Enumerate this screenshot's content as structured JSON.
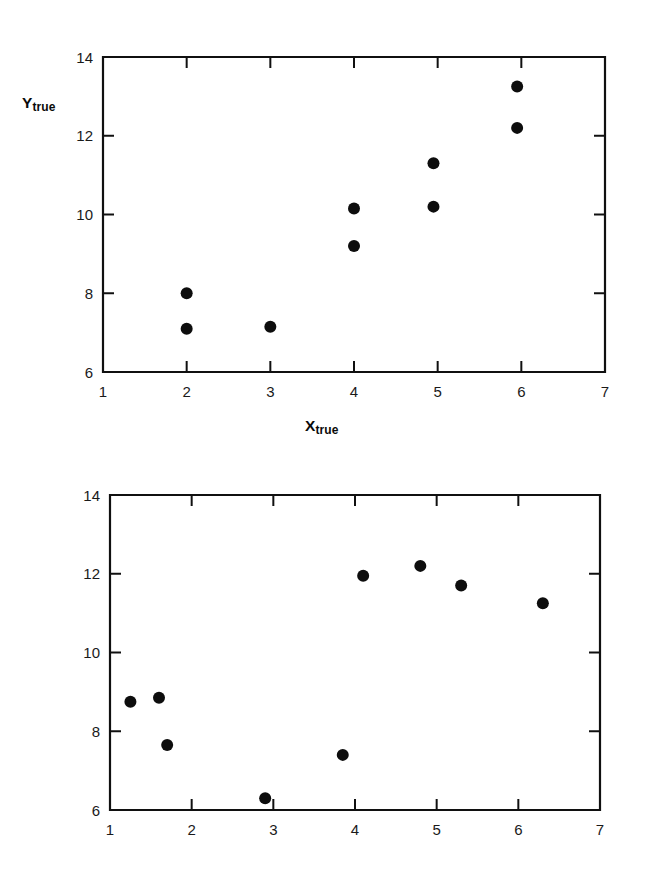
{
  "figure": {
    "background_color": "#ffffff",
    "marker_color": "#0d0d0d",
    "axis_color": "#101010"
  },
  "panels": [
    {
      "id": "top",
      "x_title_main": "X",
      "x_title_sub": "true",
      "y_title_main": "Y",
      "y_title_sub": "true"
    },
    {
      "id": "bottom",
      "x_title_main": "X",
      "x_title_sub": "error",
      "y_title_main": "Y",
      "y_title_sub": "error"
    }
  ],
  "chart_data": [
    {
      "type": "scatter",
      "title": "",
      "xlabel": "X_true",
      "ylabel": "Y_true",
      "xlim": [
        1,
        7
      ],
      "ylim": [
        6,
        14
      ],
      "xticks": [
        1,
        2,
        3,
        4,
        5,
        6,
        7
      ],
      "yticks": [
        6,
        8,
        10,
        12,
        14
      ],
      "xticklabels": [
        "1",
        "2",
        "3",
        "4",
        "5",
        "6",
        "7"
      ],
      "yticklabels": [
        "6",
        "8",
        "10",
        "12",
        "14"
      ],
      "grid": false,
      "legend": null,
      "marker": "filled-circle",
      "points": [
        {
          "x": 2.0,
          "y": 8.0
        },
        {
          "x": 2.0,
          "y": 7.1
        },
        {
          "x": 3.0,
          "y": 7.15
        },
        {
          "x": 4.0,
          "y": 10.15
        },
        {
          "x": 4.0,
          "y": 9.2
        },
        {
          "x": 4.95,
          "y": 11.3
        },
        {
          "x": 4.95,
          "y": 10.2
        },
        {
          "x": 5.95,
          "y": 13.25
        },
        {
          "x": 5.95,
          "y": 12.2
        }
      ]
    },
    {
      "type": "scatter",
      "title": "",
      "xlabel": "X_error",
      "ylabel": "Y_error",
      "xlim": [
        1,
        7
      ],
      "ylim": [
        6,
        14
      ],
      "xticks": [
        1,
        2,
        3,
        4,
        5,
        6,
        7
      ],
      "yticks": [
        6,
        8,
        10,
        12,
        14
      ],
      "xticklabels": [
        "1",
        "2",
        "3",
        "4",
        "5",
        "6",
        "7"
      ],
      "yticklabels": [
        "6",
        "8",
        "10",
        "12",
        "14"
      ],
      "grid": false,
      "legend": null,
      "marker": "filled-circle",
      "points": [
        {
          "x": 1.25,
          "y": 8.75
        },
        {
          "x": 1.6,
          "y": 8.85
        },
        {
          "x": 1.7,
          "y": 7.65
        },
        {
          "x": 2.9,
          "y": 6.3
        },
        {
          "x": 3.85,
          "y": 7.4
        },
        {
          "x": 4.1,
          "y": 11.95
        },
        {
          "x": 4.8,
          "y": 12.2
        },
        {
          "x": 5.3,
          "y": 11.7
        },
        {
          "x": 6.3,
          "y": 11.25
        }
      ]
    }
  ]
}
